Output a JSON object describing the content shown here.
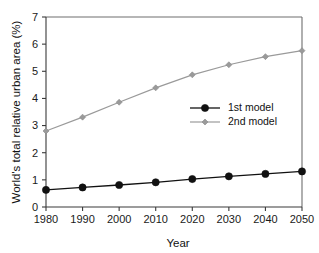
{
  "chart_data": {
    "type": "line",
    "title": "",
    "xlabel": "Year",
    "ylabel": "World's total relative urban area (%)",
    "x": [
      1980,
      1990,
      2000,
      2010,
      2020,
      2030,
      2040,
      2050
    ],
    "xtick_labels": [
      "1980",
      "1990",
      "2000",
      "2010",
      "2020",
      "2030",
      "2040",
      "2050"
    ],
    "ytick_labels": [
      "0",
      "1",
      "2",
      "3",
      "4",
      "5",
      "6",
      "7"
    ],
    "yticks": [
      0,
      1,
      2,
      3,
      4,
      5,
      6,
      7
    ],
    "xlim": [
      1980,
      2050
    ],
    "ylim": [
      0,
      7
    ],
    "grid": false,
    "legend_position": "center-right",
    "series": [
      {
        "name": "1st model",
        "color": "#111111",
        "marker": "circle",
        "values": [
          0.63,
          0.72,
          0.81,
          0.91,
          1.03,
          1.13,
          1.22,
          1.31
        ]
      },
      {
        "name": "2nd model",
        "color": "#9a9a9a",
        "marker": "diamond",
        "values": [
          2.8,
          3.31,
          3.86,
          4.39,
          4.87,
          5.24,
          5.54,
          5.76
        ]
      }
    ]
  },
  "legend": {
    "entries": [
      {
        "label": "1st model"
      },
      {
        "label": "2nd model"
      }
    ]
  },
  "axes": {
    "x_title": "Year",
    "y_title": "World's total relative urban area (%)"
  }
}
